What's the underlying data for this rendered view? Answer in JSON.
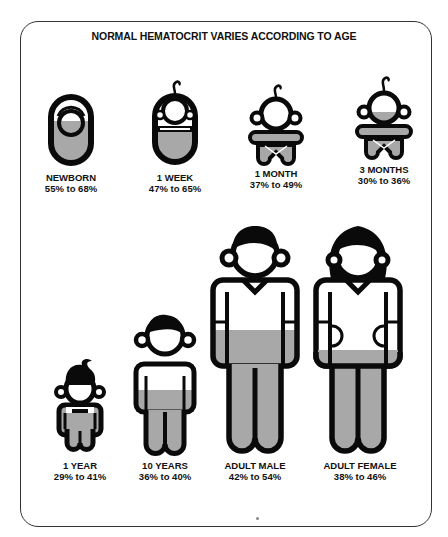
{
  "title": "NORMAL HEMATOCRIT VARIES ACCORDING TO AGE",
  "colors": {
    "outline": "#0a0a0a",
    "fill_red_cells": "#a8a8a8",
    "background": "#ffffff",
    "frame": "#333333"
  },
  "groups": [
    {
      "id": "newborn",
      "label": "NEWBORN",
      "range": "55% to 68%",
      "low": 55,
      "high": 68,
      "icon": "swaddled-newborn-icon"
    },
    {
      "id": "1-week",
      "label": "1 WEEK",
      "range": "47% to 65%",
      "low": 47,
      "high": 65,
      "icon": "swaddled-infant-icon"
    },
    {
      "id": "1-month",
      "label": "1 MONTH",
      "range": "37% to 49%",
      "low": 37,
      "high": 49,
      "icon": "baby-icon"
    },
    {
      "id": "3-months",
      "label": "3 MONTHS",
      "range": "30% to 36%",
      "low": 30,
      "high": 36,
      "icon": "baby-icon"
    },
    {
      "id": "1-year",
      "label": "1 YEAR",
      "range": "29% to 41%",
      "low": 29,
      "high": 41,
      "icon": "toddler-icon"
    },
    {
      "id": "10-years",
      "label": "10 YEARS",
      "range": "36% to 40%",
      "low": 36,
      "high": 40,
      "icon": "child-icon"
    },
    {
      "id": "adult-male",
      "label": "ADULT MALE",
      "range": "42% to 54%",
      "low": 42,
      "high": 54,
      "icon": "man-icon"
    },
    {
      "id": "adult-female",
      "label": "ADULT FEMALE",
      "range": "38% to 46%",
      "low": 38,
      "high": 46,
      "icon": "woman-icon"
    }
  ]
}
